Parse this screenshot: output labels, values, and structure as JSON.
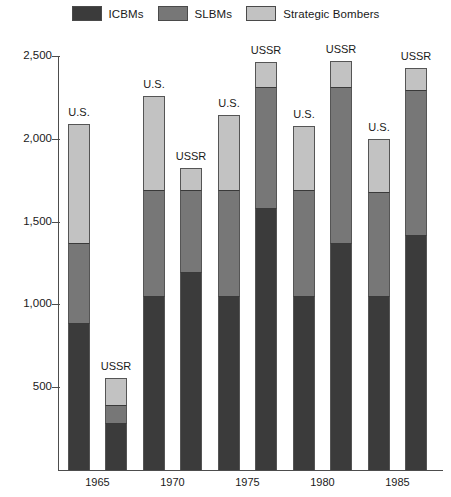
{
  "legend": {
    "entries": [
      {
        "label": "ICBMs",
        "color": "#3b3b3b",
        "name": "icbms"
      },
      {
        "label": "SLBMs",
        "color": "#777777",
        "name": "slbms"
      },
      {
        "label": "Strategic Bombers",
        "color": "#c2c2c2",
        "name": "strategic-bombers"
      }
    ]
  },
  "chart_data": {
    "type": "bar",
    "stacked": true,
    "title": "",
    "subtitle": "",
    "xlabel": "",
    "ylabel": "",
    "grid": false,
    "legend_position": "top-center",
    "categories": [
      "1965",
      "1970",
      "1975",
      "1980",
      "1985"
    ],
    "group_labels": [
      "U.S.",
      "USSR"
    ],
    "ylim": [
      0,
      2500
    ],
    "yticks": [
      500,
      1000,
      1500,
      2000,
      2500
    ],
    "ytick_labels": [
      "500",
      "1,000",
      "1,500",
      "2,000",
      "2,500"
    ],
    "series": [
      {
        "name": "ICBMs",
        "color": "#3b3b3b",
        "us": [
          890,
          1050,
          1050,
          1050,
          1050
        ],
        "ussr": [
          285,
          1195,
          1585,
          1370,
          1420
        ]
      },
      {
        "name": "SLBMs",
        "color": "#777777",
        "us": [
          480,
          640,
          640,
          640,
          630
        ],
        "ussr": [
          110,
          495,
          725,
          940,
          875
        ]
      },
      {
        "name": "Strategic Bombers",
        "color": "#c2c2c2",
        "us": [
          720,
          570,
          455,
          385,
          320
        ],
        "ussr": [
          160,
          135,
          155,
          160,
          135
        ]
      }
    ],
    "totals": {
      "us": [
        2090,
        2260,
        2145,
        2075,
        2000
      ],
      "ussr": [
        555,
        1825,
        2465,
        2470,
        2430
      ]
    }
  }
}
